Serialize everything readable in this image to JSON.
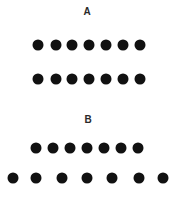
{
  "panels": [
    {
      "label": "A",
      "label_pos": [
        87,
        12
      ],
      "rows": [
        {
          "name": "row-a-top",
          "y": 45,
          "xs": [
            38,
            56,
            72,
            89,
            106,
            123,
            140
          ]
        },
        {
          "name": "row-a-bottom",
          "y": 79,
          "xs": [
            38,
            56,
            72,
            89,
            106,
            123,
            140
          ]
        }
      ]
    },
    {
      "label": "B",
      "label_pos": [
        88,
        120
      ],
      "rows": [
        {
          "name": "row-b-top",
          "y": 148,
          "xs": [
            36,
            53,
            70,
            87,
            104,
            121,
            138
          ]
        },
        {
          "name": "row-b-bottom",
          "y": 178,
          "xs": [
            13,
            36,
            62,
            87,
            112,
            139,
            163
          ]
        }
      ]
    }
  ],
  "style": {
    "dot_color": "#111111",
    "dot_diameter": 11,
    "label_color": "#2a2a2a"
  }
}
